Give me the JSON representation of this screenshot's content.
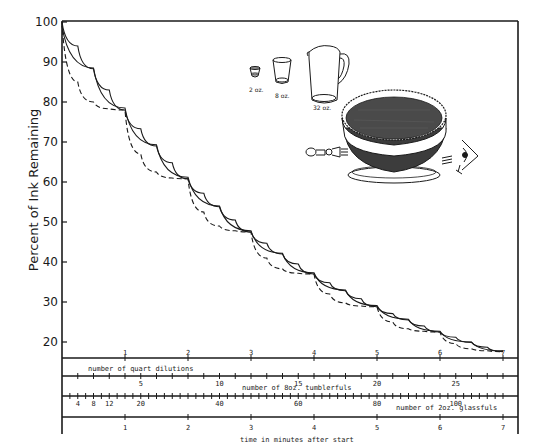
{
  "chart_data": {
    "type": "line",
    "title": "",
    "ylabel": "Percent of Ink Remaining",
    "xlabel": "time in minutes after start",
    "ylim": [
      18,
      100
    ],
    "xlim": [
      0,
      7
    ],
    "grid": false,
    "y_ticks": [
      100,
      90,
      80,
      70,
      60,
      50,
      40,
      30,
      20
    ],
    "x_ticks": [
      1,
      2,
      3,
      4,
      5,
      6,
      7
    ],
    "secondary_axes": [
      {
        "label": "number of quart dilutions",
        "ticks": [
          1,
          2,
          3,
          4,
          5,
          6,
          7
        ]
      },
      {
        "label": "number of 8oz. tumblerfuls",
        "ticks": [
          5,
          10,
          15,
          20,
          25
        ]
      },
      {
        "label": "number of 2oz. glassfuls",
        "ticks": [
          4,
          8,
          12,
          20,
          40,
          60,
          80,
          100
        ]
      }
    ],
    "series": [
      {
        "name": "32 oz. (quart) dilutions",
        "style": "dashed",
        "x": [
          0,
          0.25,
          0.5,
          0.75,
          1,
          1.25,
          1.5,
          1.75,
          2,
          2.25,
          2.5,
          2.75,
          3,
          3.25,
          3.5,
          3.75,
          4,
          4.25,
          4.5,
          4.75,
          5,
          5.25,
          5.5,
          5.75,
          6,
          6.25,
          6.5,
          6.75,
          7
        ],
        "values": [
          100,
          85,
          80,
          78.3,
          78,
          67,
          62.5,
          61,
          60.8,
          52.5,
          49,
          47.8,
          47.5,
          41,
          38.3,
          37.2,
          37,
          32,
          29.8,
          29,
          28.8,
          25,
          23.3,
          22.7,
          22.5,
          19.6,
          18.3,
          17.8,
          17.6
        ]
      },
      {
        "name": "8 oz. tumbler dilutions",
        "style": "solid",
        "x": [
          0,
          0.25,
          0.5,
          0.75,
          1,
          1.25,
          1.5,
          1.75,
          2,
          2.25,
          2.5,
          2.75,
          3,
          3.25,
          3.5,
          3.75,
          4,
          4.25,
          4.5,
          4.75,
          5,
          5.25,
          5.5,
          5.75,
          6,
          6.25,
          6.5,
          6.75,
          7
        ],
        "values": [
          100,
          94,
          88.3,
          83,
          78,
          73.3,
          69,
          64.8,
          60.8,
          57.2,
          53.8,
          50.5,
          47.5,
          44.7,
          42,
          39.5,
          37,
          34.8,
          32.8,
          30.8,
          28.8,
          27.1,
          25.5,
          24,
          22.5,
          21.2,
          19.9,
          18.7,
          17.6
        ]
      },
      {
        "name": "2 oz. glass dilutions",
        "style": "solid",
        "x": [
          0,
          0.5,
          1,
          1.5,
          2,
          2.5,
          3,
          3.5,
          4,
          4.5,
          5,
          5.5,
          6,
          6.5,
          7
        ],
        "values": [
          99,
          88.5,
          78.5,
          69.3,
          61.2,
          54,
          47.8,
          42.2,
          37.3,
          33,
          29.1,
          25.7,
          22.7,
          20,
          17.8
        ]
      }
    ]
  },
  "axis": {
    "y_title": "Percent of Ink Remaining",
    "x_title": "time in minutes after start",
    "quart_title": "number of quart dilutions",
    "tumbler_title": "number of 8oz. tumblerfuls",
    "glass_title": "number of 2oz. glassfuls",
    "y_labels": [
      "100",
      "90",
      "80",
      "70",
      "60",
      "50",
      "40",
      "30",
      "20"
    ],
    "time_labels": [
      "1",
      "2",
      "3",
      "4",
      "5",
      "6",
      "7"
    ],
    "quart_labels": [
      "1",
      "2",
      "3",
      "4",
      "5",
      "6",
      "7"
    ],
    "tumbler_labels": [
      "5",
      "10",
      "15",
      "20",
      "25"
    ],
    "glass_labels": [
      "4",
      "8",
      "12",
      "20",
      "40",
      "60",
      "80",
      "100"
    ]
  },
  "illustration": {
    "glass_2oz": "2 oz.",
    "tumbler_8oz": "8 oz.",
    "pitcher_32oz": "32 oz."
  },
  "colors": {
    "ink": "#1a1a1a",
    "background": "#ffffff",
    "bowl_fill": "#4a4a4a"
  }
}
